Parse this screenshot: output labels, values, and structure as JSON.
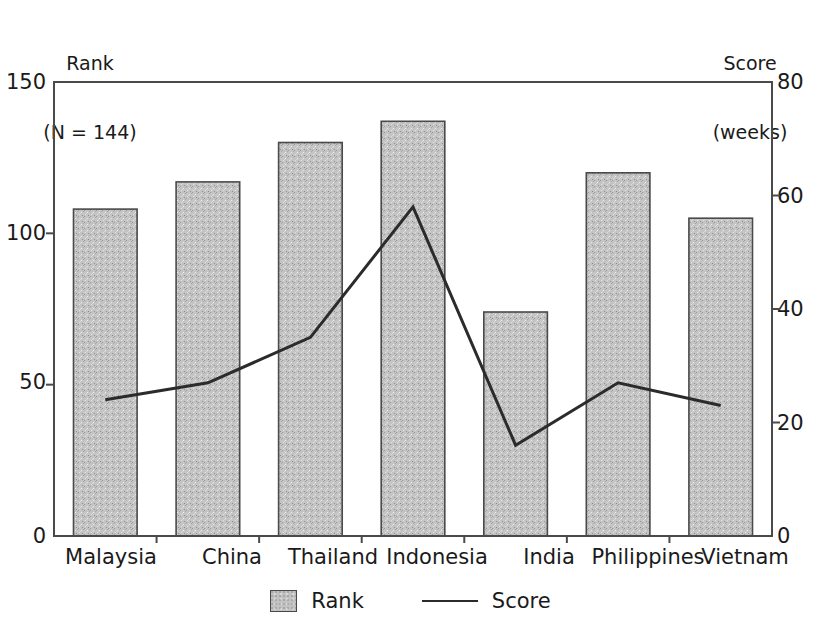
{
  "chart_data": {
    "type": "bar",
    "title": "",
    "subtitle": "",
    "categories": [
      "Malaysia",
      "China",
      "Thailand",
      "Indonesia",
      "India",
      "Philippines",
      "Vietnam"
    ],
    "series": [
      {
        "name": "Rank",
        "type": "bar",
        "axis": "left",
        "values": [
          108,
          117,
          130,
          137,
          74,
          120,
          105
        ]
      },
      {
        "name": "Score",
        "type": "line",
        "axis": "right",
        "values": [
          24,
          27,
          35,
          58,
          16,
          27,
          23
        ]
      }
    ],
    "left_axis": {
      "label": "Rank",
      "sublabel": "(N = 144)",
      "ticks": [
        0,
        50,
        100,
        150
      ],
      "ylim": [
        0,
        150
      ]
    },
    "right_axis": {
      "label": "Score",
      "sublabel": "(weeks)",
      "ticks": [
        0,
        20,
        40,
        60,
        80
      ],
      "ylim": [
        0,
        80
      ]
    },
    "xlabel": "",
    "grid": false,
    "legend_position": "bottom",
    "colors": {
      "bar_fill": "#c2c2c2",
      "bar_stroke": "#4a4a4a",
      "line": "#2b2b2b",
      "axis": "#4a4a4a",
      "text": "#1a1a1a"
    }
  },
  "legend": {
    "entries": [
      {
        "label": "Rank",
        "marker": "bar-swatch"
      },
      {
        "label": "Score",
        "marker": "line-swatch"
      }
    ]
  },
  "left_axis_title_line1": "Rank",
  "left_axis_title_line2": "(N = 144)",
  "right_axis_title_line1": "Score",
  "right_axis_title_line2": "(weeks)",
  "left_ticks": [
    "150",
    "100",
    "50",
    "0"
  ],
  "right_ticks": [
    "80",
    "60",
    "40",
    "20",
    "0"
  ],
  "categories": [
    "Malaysia",
    "China",
    "Thailand",
    "Indonesia",
    "India",
    "Philippines",
    "Vietnam"
  ]
}
